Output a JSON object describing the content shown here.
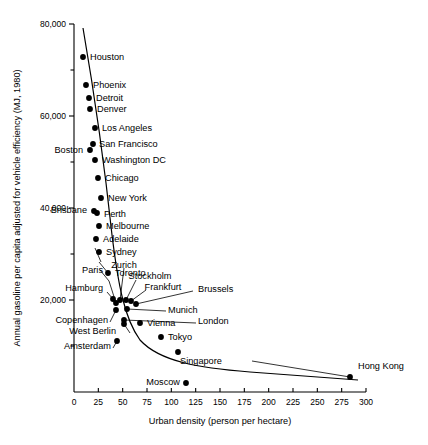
{
  "chart_data": {
    "type": "scatter",
    "title": "",
    "xlabel": "Urban density (person per hectare)",
    "ylabel": "Annual gasoline per capita adjusted for vehicle efficiency (MJ, 1980)",
    "xlim": [
      0,
      300
    ],
    "ylim": [
      0,
      80000
    ],
    "grid": false,
    "legend": "none",
    "xticks": [
      "0",
      "25",
      "50",
      "75",
      "100",
      "125",
      "150",
      "175",
      "200",
      "225",
      "250",
      "275",
      "300"
    ],
    "xtick_values": [
      0,
      25,
      50,
      75,
      100,
      125,
      150,
      175,
      200,
      225,
      250,
      275,
      300
    ],
    "yticks": [
      "80,000",
      "60,000",
      "40,000",
      "20,000"
    ],
    "ytick_values": [
      80000,
      60000,
      40000,
      20000
    ],
    "yticks_minor": [
      70000,
      50000,
      30000,
      10000
    ],
    "points": [
      {
        "label": "Houston",
        "x": 10,
        "y": 74500
      },
      {
        "label": "Phoenix",
        "x": 13,
        "y": 68500
      },
      {
        "label": "Detroit",
        "x": 15,
        "y": 65800
      },
      {
        "label": "Denver",
        "x": 16,
        "y": 63500
      },
      {
        "label": "Los Angeles",
        "x": 20,
        "y": 59500
      },
      {
        "label": "San Francisco",
        "x": 21,
        "y": 56500
      },
      {
        "label": "Boston",
        "x": 18,
        "y": 55500
      },
      {
        "label": "Washington DC",
        "x": 22,
        "y": 53000
      },
      {
        "label": "Chicago",
        "x": 24,
        "y": 49500
      },
      {
        "label": "New York",
        "x": 26,
        "y": 45000
      },
      {
        "label": "Brisbane",
        "x": 21,
        "y": 42200
      },
      {
        "label": "Perth",
        "x": 23,
        "y": 41800
      },
      {
        "label": "Melbourne",
        "x": 24,
        "y": 39500
      },
      {
        "label": "Adelaide",
        "x": 22,
        "y": 36800
      },
      {
        "label": "Sydney",
        "x": 25,
        "y": 33800
      },
      {
        "label": "Toronto",
        "x": 40,
        "y": 32000
      },
      {
        "label": "Hamburg",
        "x": 45,
        "y": 21500
      },
      {
        "label": "Paris",
        "x": 48,
        "y": 20800
      },
      {
        "label": "Zurich",
        "x": 52,
        "y": 20600
      },
      {
        "label": "Stockholm",
        "x": 55,
        "y": 20400
      },
      {
        "label": "Frankfurt",
        "x": 57,
        "y": 20200
      },
      {
        "label": "Brussels",
        "x": 60,
        "y": 19900
      },
      {
        "label": "Copenhagen",
        "x": 38,
        "y": 18500
      },
      {
        "label": "Munich",
        "x": 65,
        "y": 18700
      },
      {
        "label": "London",
        "x": 53,
        "y": 16500
      },
      {
        "label": "West Berlin",
        "x": 54,
        "y": 16100
      },
      {
        "label": "Vienna",
        "x": 70,
        "y": 15400
      },
      {
        "label": "Amsterdam",
        "x": 50,
        "y": 12900
      },
      {
        "label": "Tokyo",
        "x": 90,
        "y": 12700
      },
      {
        "label": "Singapore",
        "x": 105,
        "y": 11200
      },
      {
        "label": "Moscow",
        "x": 140,
        "y": 6200
      },
      {
        "label": "Hong Kong",
        "x": 290,
        "y": 7000
      }
    ],
    "trend_description": "decreasing curve from high gasoline use at low urban density to low gasoline use at high urban density"
  },
  "axis": {
    "x_title": "Urban density (person per hectare)",
    "y_title": "Annual gasoline per capita adjusted for vehicle efficiency (MJ, 1980)"
  }
}
